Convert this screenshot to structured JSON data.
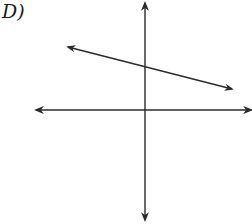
{
  "option_label": "D)",
  "colors": {
    "stroke": "#2a2a2a",
    "background": "#ffffff"
  },
  "graph": {
    "x_axis": {
      "y": 110,
      "x_start": 36,
      "x_end": 251,
      "arrows": "both"
    },
    "y_axis": {
      "x": 145,
      "y_start": 3,
      "y_end": 220,
      "arrows": "both"
    },
    "line": {
      "x1": 68,
      "y1": 47,
      "x2": 232,
      "y2": 89,
      "arrows": "both",
      "slope": "negative",
      "y_intercept": "positive"
    }
  }
}
